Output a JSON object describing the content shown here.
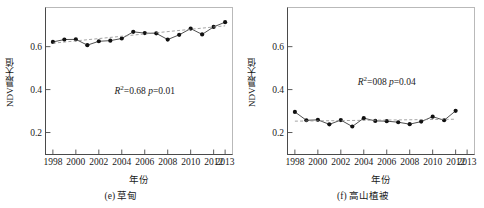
{
  "figure": {
    "panels": [
      {
        "id": "panel-e",
        "caption": "(e) 草甸",
        "xlabel": "年份",
        "ylabel": "NDVI最大值",
        "annotation": {
          "r2_label": "R",
          "r2_sup": "2",
          "r2_value": "=0.68",
          "p_label": "p",
          "p_value": "=0.01"
        }
      },
      {
        "id": "panel-f",
        "caption": "(f) 高山植被",
        "xlabel": "年份",
        "ylabel": "NDVI最大值",
        "annotation": {
          "r2_label": "R",
          "r2_sup": "2",
          "r2_value": "=008",
          "p_label": "p",
          "p_value": "=0.04"
        }
      }
    ]
  },
  "chart_data": [
    {
      "type": "line",
      "title": "(e) 草甸",
      "xlabel": "年份",
      "ylabel": "NDVI最大值",
      "xlim": [
        1997.4,
        2013.6
      ],
      "ylim": [
        0.1,
        0.78
      ],
      "xticks": [
        1998,
        2000,
        2002,
        2004,
        2006,
        2008,
        2010,
        2012,
        2013
      ],
      "xticklabels": [
        "1998",
        "2000",
        "2002",
        "2004",
        "2006",
        "2008",
        "2010",
        "2012",
        "2013"
      ],
      "yticks": [
        0.2,
        0.4,
        0.6
      ],
      "yticklabels": [
        "0.2",
        "0.4",
        "0.6"
      ],
      "grid": false,
      "legend": null,
      "marker": "filled-circle",
      "series": [
        {
          "name": "NDVI最大值",
          "style": "solid-line-with-markers",
          "x": [
            1998,
            1999,
            2000,
            2001,
            2002,
            2003,
            2004,
            2005,
            2006,
            2007,
            2008,
            2009,
            2010,
            2011,
            2012,
            2013
          ],
          "values": [
            0.622,
            0.633,
            0.634,
            0.607,
            0.625,
            0.628,
            0.638,
            0.669,
            0.663,
            0.662,
            0.633,
            0.655,
            0.684,
            0.657,
            0.692,
            0.714
          ]
        },
        {
          "name": "线性趋势",
          "style": "dashed-trend-line",
          "x": [
            1998,
            2013
          ],
          "values": [
            0.616,
            0.697
          ]
        }
      ],
      "annotations": [
        {
          "text": "R2=0.68 p=0.01",
          "x": 2006.0,
          "y": 0.4
        }
      ]
    },
    {
      "type": "line",
      "title": "(f) 高山植被",
      "xlabel": "年份",
      "ylabel": "NDVI最大值",
      "xlim": [
        1997.4,
        2013.6
      ],
      "ylim": [
        0.1,
        0.78
      ],
      "xticks": [
        1998,
        2000,
        2002,
        2004,
        2006,
        2008,
        2010,
        2012,
        2013
      ],
      "xticklabels": [
        "1998",
        "2000",
        "2002",
        "2004",
        "2006",
        "2008",
        "2010",
        "2012",
        "2013"
      ],
      "yticks": [
        0.2,
        0.4,
        0.6
      ],
      "yticklabels": [
        "0.2",
        "0.4",
        "0.6"
      ],
      "grid": false,
      "legend": null,
      "marker": "filled-circle",
      "series": [
        {
          "name": "NDVI最大值",
          "style": "solid-line-with-markers",
          "x": [
            1998,
            1999,
            2000,
            2001,
            2002,
            2003,
            2004,
            2005,
            2006,
            2007,
            2008,
            2009,
            2010,
            2011,
            2012
          ],
          "values": [
            0.296,
            0.257,
            0.259,
            0.238,
            0.258,
            0.228,
            0.267,
            0.254,
            0.253,
            0.248,
            0.239,
            0.251,
            0.274,
            0.257,
            0.301
          ]
        },
        {
          "name": "线性趋势",
          "style": "dashed-trend-line",
          "x": [
            1998,
            2012
          ],
          "values": [
            0.253,
            0.262
          ]
        }
      ],
      "annotations": [
        {
          "text": "R2=008 p=0.04",
          "x": 2006.0,
          "y": 0.44
        }
      ]
    }
  ]
}
